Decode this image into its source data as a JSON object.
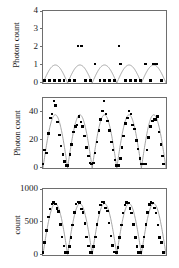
{
  "figure": {
    "background_color": "#ffffff",
    "frame_color": "#6e6e6e",
    "curve_color": "#9a9a9a",
    "marker_color": "#000000",
    "panel_count": 3
  },
  "chart_data": [
    {
      "type": "scatter",
      "panel_index": 0,
      "title": "",
      "xlabel": "",
      "ylabel": "Photon count",
      "yticks": [
        0,
        1,
        2,
        3,
        4
      ],
      "ytick_labels": [
        "0",
        "1",
        "2",
        "3",
        "4"
      ],
      "ylim": [
        0,
        4
      ],
      "xlim": [
        0,
        1
      ],
      "grid": false,
      "legend": null,
      "curve": {
        "name": "rectified sine fit",
        "description": "five rectified sine half-periods of amplitude 1",
        "amplitude": 1.0,
        "periods": 5,
        "baseline": 0
      },
      "points": [
        {
          "x": 0.02,
          "y": 0
        },
        {
          "x": 0.06,
          "y": 0
        },
        {
          "x": 0.1,
          "y": 0
        },
        {
          "x": 0.14,
          "y": 0
        },
        {
          "x": 0.18,
          "y": 0
        },
        {
          "x": 0.222,
          "y": 0
        },
        {
          "x": 0.262,
          "y": 0
        },
        {
          "x": 0.292,
          "y": 2
        },
        {
          "x": 0.322,
          "y": 2
        },
        {
          "x": 0.352,
          "y": 0
        },
        {
          "x": 0.392,
          "y": 0
        },
        {
          "x": 0.432,
          "y": 1
        },
        {
          "x": 0.47,
          "y": 0
        },
        {
          "x": 0.51,
          "y": 0
        },
        {
          "x": 0.548,
          "y": 0
        },
        {
          "x": 0.588,
          "y": 0
        },
        {
          "x": 0.625,
          "y": 2
        },
        {
          "x": 0.64,
          "y": 1
        },
        {
          "x": 0.68,
          "y": 0
        },
        {
          "x": 0.72,
          "y": 0
        },
        {
          "x": 0.76,
          "y": 0
        },
        {
          "x": 0.8,
          "y": 0
        },
        {
          "x": 0.84,
          "y": 1
        },
        {
          "x": 0.88,
          "y": 0
        },
        {
          "x": 0.905,
          "y": 1
        },
        {
          "x": 0.932,
          "y": 1
        },
        {
          "x": 0.97,
          "y": 0
        }
      ]
    },
    {
      "type": "scatter",
      "panel_index": 1,
      "title": "",
      "xlabel": "",
      "ylabel": "Photon count",
      "yticks": [
        0,
        20,
        40
      ],
      "ytick_labels": [
        "0",
        "20",
        "40"
      ],
      "ylim": [
        0,
        50
      ],
      "xlim": [
        0,
        1
      ],
      "grid": false,
      "legend": null,
      "curve": {
        "name": "rectified sine fit",
        "description": "five rectified sine half-periods peaking near 38",
        "amplitude": 38,
        "periods": 5,
        "baseline": 0
      },
      "points": [
        {
          "x": 0.008,
          "y": 2
        },
        {
          "x": 0.022,
          "y": 12
        },
        {
          "x": 0.038,
          "y": 10
        },
        {
          "x": 0.052,
          "y": 24
        },
        {
          "x": 0.068,
          "y": 35
        },
        {
          "x": 0.082,
          "y": 38
        },
        {
          "x": 0.098,
          "y": 47
        },
        {
          "x": 0.112,
          "y": 44
        },
        {
          "x": 0.126,
          "y": 32
        },
        {
          "x": 0.14,
          "y": 23
        },
        {
          "x": 0.155,
          "y": 15
        },
        {
          "x": 0.17,
          "y": 9
        },
        {
          "x": 0.185,
          "y": 4
        },
        {
          "x": 0.198,
          "y": 1
        },
        {
          "x": 0.212,
          "y": 1
        },
        {
          "x": 0.228,
          "y": 9
        },
        {
          "x": 0.242,
          "y": 16
        },
        {
          "x": 0.258,
          "y": 25
        },
        {
          "x": 0.272,
          "y": 29
        },
        {
          "x": 0.286,
          "y": 30
        },
        {
          "x": 0.3,
          "y": 36
        },
        {
          "x": 0.316,
          "y": 32
        },
        {
          "x": 0.33,
          "y": 29
        },
        {
          "x": 0.346,
          "y": 22
        },
        {
          "x": 0.36,
          "y": 14
        },
        {
          "x": 0.376,
          "y": 8
        },
        {
          "x": 0.39,
          "y": 3
        },
        {
          "x": 0.404,
          "y": 2
        },
        {
          "x": 0.418,
          "y": 3
        },
        {
          "x": 0.432,
          "y": 10
        },
        {
          "x": 0.448,
          "y": 18
        },
        {
          "x": 0.462,
          "y": 26
        },
        {
          "x": 0.476,
          "y": 34
        },
        {
          "x": 0.49,
          "y": 40
        },
        {
          "x": 0.505,
          "y": 47
        },
        {
          "x": 0.52,
          "y": 38
        },
        {
          "x": 0.534,
          "y": 33
        },
        {
          "x": 0.548,
          "y": 26
        },
        {
          "x": 0.564,
          "y": 18
        },
        {
          "x": 0.578,
          "y": 12
        },
        {
          "x": 0.592,
          "y": 5
        },
        {
          "x": 0.606,
          "y": 1
        },
        {
          "x": 0.62,
          "y": 1
        },
        {
          "x": 0.636,
          "y": 6
        },
        {
          "x": 0.65,
          "y": 14
        },
        {
          "x": 0.664,
          "y": 22
        },
        {
          "x": 0.68,
          "y": 31
        },
        {
          "x": 0.694,
          "y": 35
        },
        {
          "x": 0.708,
          "y": 40
        },
        {
          "x": 0.722,
          "y": 38
        },
        {
          "x": 0.738,
          "y": 30
        },
        {
          "x": 0.752,
          "y": 27
        },
        {
          "x": 0.766,
          "y": 19
        },
        {
          "x": 0.78,
          "y": 13
        },
        {
          "x": 0.796,
          "y": 6
        },
        {
          "x": 0.81,
          "y": 2
        },
        {
          "x": 0.824,
          "y": 2
        },
        {
          "x": 0.84,
          "y": 2
        },
        {
          "x": 0.854,
          "y": 12
        },
        {
          "x": 0.868,
          "y": 21
        },
        {
          "x": 0.882,
          "y": 29
        },
        {
          "x": 0.896,
          "y": 33
        },
        {
          "x": 0.91,
          "y": 34
        },
        {
          "x": 0.924,
          "y": 34
        },
        {
          "x": 0.938,
          "y": 36
        },
        {
          "x": 0.952,
          "y": 25
        },
        {
          "x": 0.966,
          "y": 16
        },
        {
          "x": 0.98,
          "y": 8
        },
        {
          "x": 0.994,
          "y": 2
        }
      ]
    },
    {
      "type": "scatter",
      "panel_index": 2,
      "title": "",
      "xlabel": "",
      "ylabel": "count",
      "yticks": [
        0,
        500,
        1000
      ],
      "ytick_labels": [
        "0",
        "500",
        "1000"
      ],
      "ylim": [
        0,
        1000
      ],
      "xlim": [
        0,
        1
      ],
      "grid": false,
      "legend": null,
      "curve": {
        "name": "rectified sine fit",
        "description": "five rectified sine half-periods peaking near 770",
        "amplitude": 770,
        "periods": 5,
        "baseline": 10
      },
      "points": [
        {
          "x": 0.008,
          "y": 20
        },
        {
          "x": 0.022,
          "y": 170
        },
        {
          "x": 0.038,
          "y": 360
        },
        {
          "x": 0.052,
          "y": 560
        },
        {
          "x": 0.066,
          "y": 680
        },
        {
          "x": 0.08,
          "y": 760
        },
        {
          "x": 0.094,
          "y": 780
        },
        {
          "x": 0.108,
          "y": 760
        },
        {
          "x": 0.122,
          "y": 690
        },
        {
          "x": 0.136,
          "y": 640
        },
        {
          "x": 0.15,
          "y": 450
        },
        {
          "x": 0.164,
          "y": 260
        },
        {
          "x": 0.178,
          "y": 120
        },
        {
          "x": 0.192,
          "y": 25
        },
        {
          "x": 0.208,
          "y": 20
        },
        {
          "x": 0.222,
          "y": 110
        },
        {
          "x": 0.236,
          "y": 250
        },
        {
          "x": 0.25,
          "y": 440
        },
        {
          "x": 0.264,
          "y": 630
        },
        {
          "x": 0.278,
          "y": 760
        },
        {
          "x": 0.292,
          "y": 790
        },
        {
          "x": 0.306,
          "y": 780
        },
        {
          "x": 0.32,
          "y": 680
        },
        {
          "x": 0.334,
          "y": 630
        },
        {
          "x": 0.348,
          "y": 460
        },
        {
          "x": 0.362,
          "y": 260
        },
        {
          "x": 0.376,
          "y": 120
        },
        {
          "x": 0.39,
          "y": 25
        },
        {
          "x": 0.404,
          "y": 20
        },
        {
          "x": 0.42,
          "y": 110
        },
        {
          "x": 0.434,
          "y": 260
        },
        {
          "x": 0.448,
          "y": 450
        },
        {
          "x": 0.462,
          "y": 630
        },
        {
          "x": 0.476,
          "y": 740
        },
        {
          "x": 0.49,
          "y": 790
        },
        {
          "x": 0.504,
          "y": 780
        },
        {
          "x": 0.518,
          "y": 700
        },
        {
          "x": 0.532,
          "y": 650
        },
        {
          "x": 0.546,
          "y": 470
        },
        {
          "x": 0.56,
          "y": 270
        },
        {
          "x": 0.574,
          "y": 130
        },
        {
          "x": 0.588,
          "y": 30
        },
        {
          "x": 0.604,
          "y": 20
        },
        {
          "x": 0.618,
          "y": 100
        },
        {
          "x": 0.632,
          "y": 250
        },
        {
          "x": 0.646,
          "y": 440
        },
        {
          "x": 0.66,
          "y": 620
        },
        {
          "x": 0.674,
          "y": 740
        },
        {
          "x": 0.688,
          "y": 780
        },
        {
          "x": 0.702,
          "y": 770
        },
        {
          "x": 0.716,
          "y": 690
        },
        {
          "x": 0.73,
          "y": 620
        },
        {
          "x": 0.744,
          "y": 450
        },
        {
          "x": 0.758,
          "y": 250
        },
        {
          "x": 0.772,
          "y": 110
        },
        {
          "x": 0.786,
          "y": 25
        },
        {
          "x": 0.802,
          "y": 20
        },
        {
          "x": 0.816,
          "y": 110
        },
        {
          "x": 0.83,
          "y": 260
        },
        {
          "x": 0.844,
          "y": 450
        },
        {
          "x": 0.858,
          "y": 630
        },
        {
          "x": 0.872,
          "y": 750
        },
        {
          "x": 0.886,
          "y": 780
        },
        {
          "x": 0.9,
          "y": 770
        },
        {
          "x": 0.914,
          "y": 700
        },
        {
          "x": 0.928,
          "y": 620
        },
        {
          "x": 0.942,
          "y": 440
        },
        {
          "x": 0.956,
          "y": 250
        },
        {
          "x": 0.97,
          "y": 170
        },
        {
          "x": 0.986,
          "y": 20
        }
      ]
    }
  ]
}
